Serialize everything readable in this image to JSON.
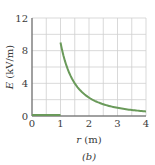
{
  "chart_data": {
    "type": "line",
    "title": "",
    "panel_label": "(b)",
    "xlabel": "r (m)",
    "xlabel_var": "r",
    "xlabel_unit": "(m)",
    "ylabel": "E (kV/m)",
    "ylabel_var": "E",
    "ylabel_unit": "(kV/m)",
    "xlim": [
      0,
      4
    ],
    "ylim": [
      0,
      12
    ],
    "xticks": [
      "0",
      "1",
      "2",
      "3",
      "4"
    ],
    "yticks": [
      "0",
      "4",
      "8",
      "12"
    ],
    "grid": true,
    "legend": null,
    "series": [
      {
        "name": "E(r)",
        "color": "#6a9a5a",
        "description": "E = 0 for r < 1 m; E = 9/r^2 kV/m for r >= 1 m",
        "x": [
          0,
          0.5,
          1.0,
          1.0,
          1.25,
          1.5,
          1.75,
          2.0,
          2.5,
          3.0,
          3.5,
          4.0
        ],
        "y": [
          0,
          0,
          0,
          9.0,
          5.76,
          4.0,
          2.94,
          2.25,
          1.44,
          1.0,
          0.73,
          0.56
        ]
      }
    ]
  },
  "style": {
    "curve_color": "#6a9a5a",
    "grid_color": "#cfcfcf",
    "axis_color": "#555555"
  }
}
